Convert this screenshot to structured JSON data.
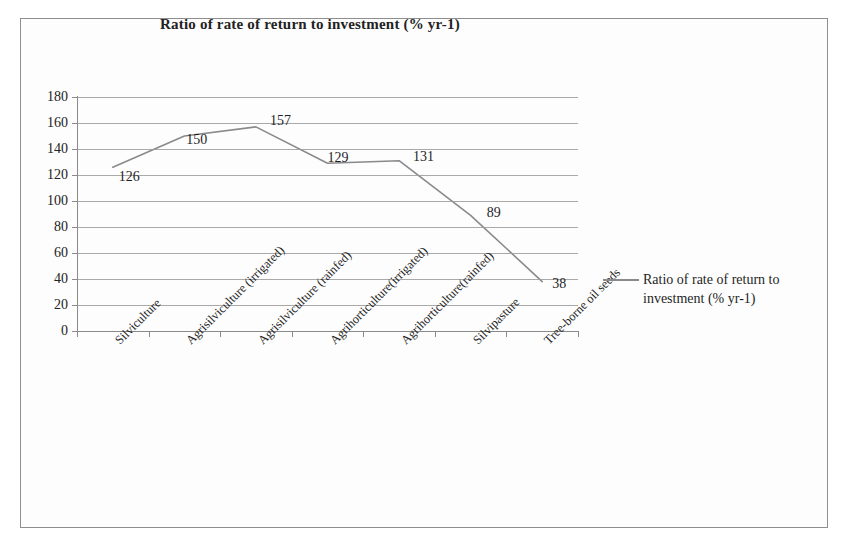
{
  "chart_data": {
    "type": "line",
    "title": "Ratio of rate of return to investment (% yr-1)",
    "xlabel": "",
    "ylabel": "",
    "ylim": [
      0,
      180
    ],
    "ytick_step": 20,
    "yticks": [
      "180",
      "160",
      "140",
      "120",
      "100",
      "80",
      "60",
      "40",
      "20",
      "0"
    ],
    "grid": true,
    "legend_position": "right",
    "categories": [
      "Silviculture",
      "Agrisilviculture (irrigated)",
      "Agrisilviculture (rainfed)",
      "Agrihorticulture(irrigated)",
      "Agrihorticulture(rainfed)",
      "Silvipasture",
      "Tree-borne oil seeds"
    ],
    "series": [
      {
        "name": "Ratio of rate of return to investment (% yr-1)",
        "values": [
          126,
          150,
          157,
          129,
          131,
          89,
          38
        ],
        "color": "#8a8a8a"
      }
    ],
    "data_labels": [
      "126",
      "150",
      "157",
      "129",
      "131",
      "89",
      "38"
    ]
  },
  "legend": {
    "label": "Ratio of rate of return to investment (% yr-1)",
    "swatch_color": "#8a8a8a"
  },
  "colors": {
    "line": "#8a8a8a",
    "grid": "#9a9a9a",
    "axis": "#8a8a8a",
    "frame": "#8e8e8e",
    "text": "#1f1f1f"
  }
}
